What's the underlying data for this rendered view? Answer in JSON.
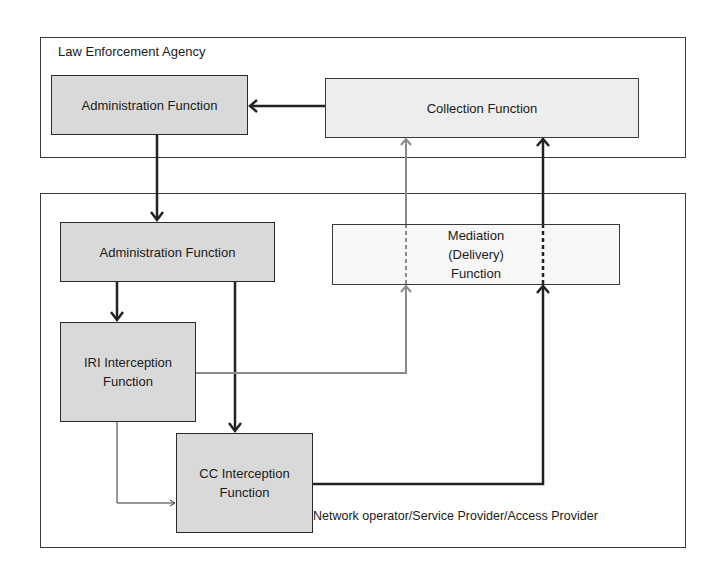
{
  "diagram": {
    "lea": {
      "title": "Law Enforcement Agency",
      "administration": "Administration Function",
      "collection": "Collection Function"
    },
    "network": {
      "title": "Network operator/Service Provider/Access Provider",
      "administration": "Administration Function",
      "iri_line1": "IRI Interception",
      "iri_line2": "Function",
      "cc_line1": "CC Interception",
      "cc_line2": "Function",
      "mediation_line1": "Mediation",
      "mediation_line2": "(Delivery)",
      "mediation_line3": "Function"
    },
    "connections": [
      {
        "from": "Collection Function",
        "to": "LEA Administration Function",
        "style": "thick-dark"
      },
      {
        "from": "LEA Administration Function",
        "to": "Network Administration Function",
        "style": "thick-dark"
      },
      {
        "from": "Network Administration Function",
        "to": "IRI Interception Function",
        "style": "thick-dark"
      },
      {
        "from": "Network Administration Function",
        "to": "CC Interception Function",
        "style": "thick-dark"
      },
      {
        "from": "IRI Interception Function",
        "to": "CC Interception Function",
        "style": "thin-dark"
      },
      {
        "from": "IRI Interception Function",
        "to": "Collection Function",
        "via": "Mediation (Delivery) Function",
        "style": "gray"
      },
      {
        "from": "CC Interception Function",
        "to": "Collection Function",
        "via": "Mediation (Delivery) Function",
        "style": "thick-dark"
      }
    ],
    "colors": {
      "box_dark_fill": "#d9d9d9",
      "box_light_fill": "#ededed",
      "line_dark": "#222222",
      "line_gray": "#8a8a8a"
    }
  }
}
